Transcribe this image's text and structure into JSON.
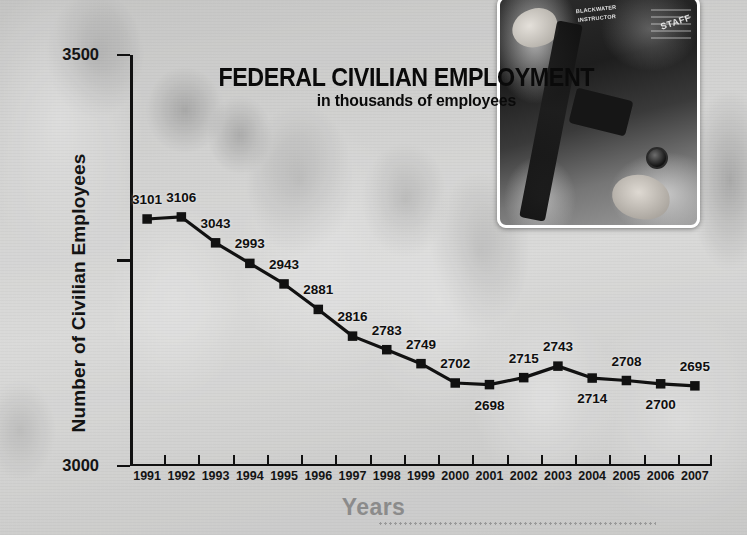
{
  "poster": {
    "title": "FEDERAL CIVILIAN EMPLOYMENT",
    "subtitle": "in thousands of employees",
    "background_photo_name": "crowd-street-photo",
    "inset_photo": {
      "name": "blackwater-contractor-photo",
      "shirt_badge_text": "BLACKWATER INSTRUCTOR",
      "sleeve_text": "STAFF"
    }
  },
  "chart_data": {
    "type": "line",
    "title": "FEDERAL CIVILIAN EMPLOYMENT",
    "subtitle": "in thousands of employees",
    "xlabel": "Years",
    "ylabel": "Number of Civilian Employees",
    "ylim": [
      2500,
      3500
    ],
    "yticks": [
      2500,
      3000,
      3500
    ],
    "grid": false,
    "legend": false,
    "marker": "square",
    "line_color": "#111111",
    "categories": [
      1991,
      1992,
      1993,
      1994,
      1995,
      1996,
      1997,
      1998,
      1999,
      2000,
      2001,
      2002,
      2003,
      2004,
      2005,
      2006,
      2007
    ],
    "values": [
      3101,
      3106,
      3043,
      2993,
      2943,
      2881,
      2816,
      2783,
      2749,
      2702,
      2698,
      2715,
      2743,
      2714,
      2708,
      2700,
      2695
    ],
    "label_positions": [
      "above",
      "above",
      "above",
      "above",
      "above",
      "above",
      "above",
      "above",
      "above",
      "above",
      "below",
      "above",
      "above",
      "below",
      "above",
      "below",
      "above"
    ]
  },
  "axes": {
    "y_tick_labels": [
      "3500",
      "3000",
      "2500"
    ],
    "x_tick_labels": [
      "1991",
      "1992",
      "1993",
      "1994",
      "1995",
      "1996",
      "1997",
      "1998",
      "1999",
      "2000",
      "2001",
      "2002",
      "2003",
      "2004",
      "2005",
      "2006",
      "2007"
    ]
  },
  "colors": {
    "line": "#111111",
    "text": "#0f0f0f",
    "xaxis_title": "#8b8b8b",
    "page_background": "#c8c8c6"
  }
}
